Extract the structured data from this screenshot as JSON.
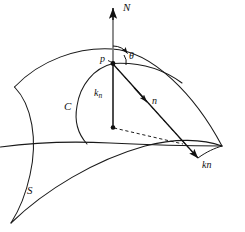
{
  "figure": {
    "stroke_color": "#1a1a1a",
    "normal_axis_color": "#7a7a7a",
    "background": "#ffffff"
  },
  "labels": {
    "surface_normal": "N",
    "point": "p",
    "angle": "θ",
    "normal_curvature_main": "k",
    "normal_curvature_sub": "n",
    "curve": "C",
    "principal_normal": "n",
    "curvature_vector": "kn",
    "surface": "S"
  },
  "elements": {
    "surface_name": "saddle-shaped surface patch",
    "curve_name": "curve C through point p",
    "normal_vector_name": "unit surface normal N",
    "normal_curvature_vector_name": "normal curvature vector k n",
    "principal_normal_vector_name": "principal normal n (dashed)",
    "curvature_vector_name": "curvature vector kn",
    "angle_arc_name": "angle theta between N and kn"
  }
}
